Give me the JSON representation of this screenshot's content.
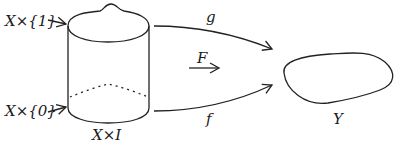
{
  "diagram": {
    "cylinder": {
      "top_label": "X×{1}",
      "bottom_label": "X×{0}",
      "base_label": "X×I"
    },
    "arrows": [
      {
        "id": "g",
        "label": "g",
        "from": "X×{1}",
        "to": "Y"
      },
      {
        "id": "F",
        "label": "F",
        "from": "X×I",
        "to": "Y"
      },
      {
        "id": "f",
        "label": "f",
        "from": "X×{0}",
        "to": "Y"
      }
    ],
    "target": {
      "label": "Y"
    },
    "colors": {
      "ink": "#222222",
      "background": "#ffffff"
    }
  }
}
